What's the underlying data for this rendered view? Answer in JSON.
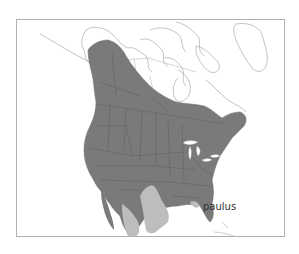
{
  "map": {
    "type": "species-range-map",
    "region": "North America",
    "frame": {
      "x": 16,
      "y": 19,
      "width": 269,
      "height": 218,
      "stroke": "#aaaaaa"
    },
    "colors": {
      "background": "#ffffff",
      "range_primary": "#7a7a7a",
      "range_secondary": "#bdbdbd",
      "boundary_lines": "#555555",
      "coastline_outline": "#9a9a9a",
      "water": "#ffffff"
    },
    "labels": [
      {
        "text": "paulus",
        "x": 204,
        "y": 209
      }
    ],
    "legend": {
      "range_primary": "dark grey range",
      "range_secondary": "light grey range"
    }
  }
}
